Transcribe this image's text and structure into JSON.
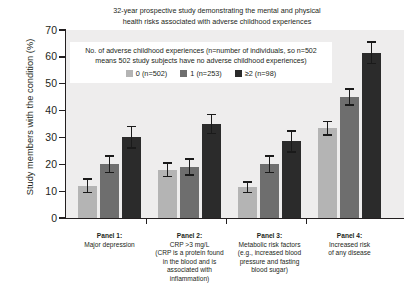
{
  "chart_data": {
    "type": "bar",
    "title": "32-year prospective study demonstrating the mental and physical health risks associated with adverse childhood experiences",
    "title_line1": "32-year prospective study demonstrating the mental and physical",
    "title_line2": "health risks associated with adverse childhood experiences",
    "xlabel": "",
    "ylabel": "Study members with the condition (%)",
    "ylim": [
      0,
      70
    ],
    "ytick_labels": [
      "0",
      "10",
      "20",
      "30",
      "40",
      "50",
      "60",
      "70"
    ],
    "ytick_values": [
      0,
      10,
      20,
      30,
      40,
      50,
      60,
      70
    ],
    "grid": false,
    "legend_position": "upper-left-inside",
    "legend_title_line1": "No. of adverse childhood experiences (n=number of individuals, so n=502",
    "legend_title_line2": "means 502 study subjects have no adverse childhood experiences)",
    "categories": [
      "Panel 1: Major depression",
      "Panel 2: CRP >3 mg/L",
      "Panel 3: Metabolic risk factors",
      "Panel 4: Increased risk of any disease"
    ],
    "series": [
      {
        "name": "0 (n=502)",
        "color": "#b4b4b4",
        "values": [
          12,
          18,
          11.5,
          33.5
        ],
        "errors": [
          2.5,
          2.5,
          2.0,
          2.5
        ]
      },
      {
        "name": "1 (n=253)",
        "color": "#6e6e6e",
        "values": [
          20,
          19,
          20,
          45
        ],
        "errors": [
          3.0,
          3.0,
          3.0,
          3.0
        ]
      },
      {
        "name": "≥2 (n=98)",
        "color": "#2b2b2b",
        "values": [
          30,
          35,
          28.5,
          61.5
        ],
        "errors": [
          4.0,
          3.5,
          4.0,
          4.0
        ]
      }
    ],
    "panels": [
      {
        "head": "Panel 1:",
        "lines": [
          "Major depression"
        ]
      },
      {
        "head": "Panel 2:",
        "lines": [
          "CRP >3 mg/L",
          "(CRP is a protein found",
          "in the blood and is",
          "associated with",
          "inflammation)"
        ]
      },
      {
        "head": "Panel 3:",
        "lines": [
          "Metabolic risk factors",
          "(e.g., increased blood",
          "pressure and fasting",
          "blood sugar)"
        ]
      },
      {
        "head": "Panel 4:",
        "lines": [
          "Increased risk",
          "of any disease"
        ]
      }
    ]
  }
}
